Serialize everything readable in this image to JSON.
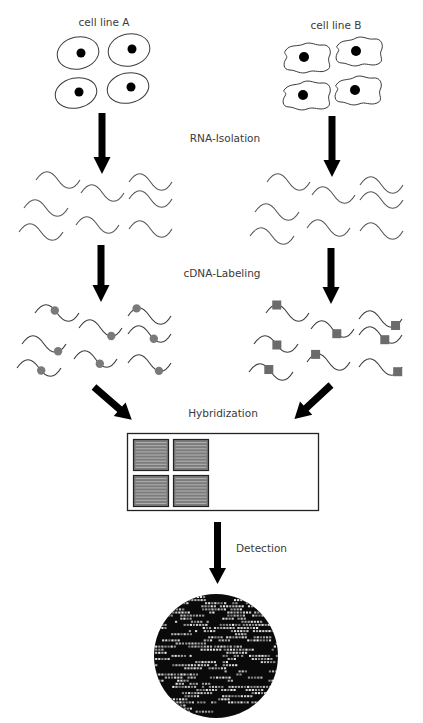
{
  "labels": {
    "cell_line_a": "cell line A",
    "cell_line_b": "cell line B",
    "rna_isolation": "RNA-Isolation",
    "cdna_labeling": "cDNA-Labeling",
    "hybridization": "Hybridization",
    "detection": "Detection"
  },
  "colors": {
    "arrow": "#000000",
    "strand": "#555555",
    "label_a": "#7a7a7a",
    "label_b": "#6b6b6b",
    "scan_background": "#0a0a0a",
    "scan_spot": "#d0d0d0"
  },
  "cell_line_a": {
    "shape": "oval",
    "count": 4
  },
  "cell_line_b": {
    "shape": "irregular",
    "count": 4
  },
  "rna_strands_per_sample": 8,
  "labeled_strands_per_sample": 8,
  "label_marker_a": "circle",
  "label_marker_b": "square",
  "microarray": {
    "subarrays": 4
  },
  "steps": [
    "RNA-Isolation",
    "cDNA-Labeling",
    "Hybridization",
    "Detection"
  ]
}
